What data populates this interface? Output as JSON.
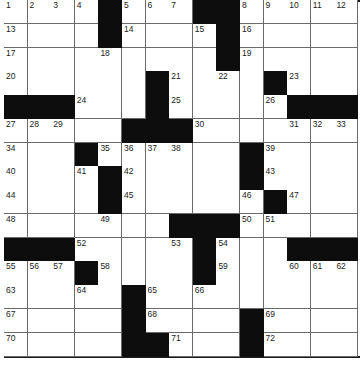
{
  "puzzle": {
    "size": {
      "rows": 15,
      "cols": 15
    },
    "colors": {
      "black": "#0d0d0d",
      "white": "#ffffff",
      "line": "#6a6a6a"
    },
    "grid": [
      "....#...##.....",
      "....#....#.....",
      ".........#.....",
      "......#....#...",
      "###...#.....###",
      ".....###.......",
      "...#......#....",
      "....#.....#....",
      "....#......#...",
      ".......###.....",
      "###.....#...###",
      "...#....#......",
      ".....#.........",
      ".....#....#....",
      ".....##...#...."
    ],
    "numbers": [
      {
        "r": 0,
        "c": 0,
        "n": "1"
      },
      {
        "r": 0,
        "c": 1,
        "n": "2"
      },
      {
        "r": 0,
        "c": 2,
        "n": "3"
      },
      {
        "r": 0,
        "c": 3,
        "n": "4"
      },
      {
        "r": 0,
        "c": 5,
        "n": "5"
      },
      {
        "r": 0,
        "c": 6,
        "n": "6"
      },
      {
        "r": 0,
        "c": 7,
        "n": "7"
      },
      {
        "r": 0,
        "c": 10,
        "n": "8"
      },
      {
        "r": 0,
        "c": 11,
        "n": "9"
      },
      {
        "r": 0,
        "c": 12,
        "n": "10"
      },
      {
        "r": 0,
        "c": 13,
        "n": "11"
      },
      {
        "r": 0,
        "c": 14,
        "n": "12"
      },
      {
        "r": 1,
        "c": 0,
        "n": "13"
      },
      {
        "r": 1,
        "c": 5,
        "n": "14"
      },
      {
        "r": 1,
        "c": 8,
        "n": "15"
      },
      {
        "r": 1,
        "c": 10,
        "n": "16"
      },
      {
        "r": 2,
        "c": 0,
        "n": "17"
      },
      {
        "r": 2,
        "c": 4,
        "n": "18"
      },
      {
        "r": 2,
        "c": 10,
        "n": "19"
      },
      {
        "r": 3,
        "c": 0,
        "n": "20"
      },
      {
        "r": 3,
        "c": 7,
        "n": "21"
      },
      {
        "r": 3,
        "c": 9,
        "n": "22"
      },
      {
        "r": 3,
        "c": 12,
        "n": "23"
      },
      {
        "r": 4,
        "c": 3,
        "n": "24"
      },
      {
        "r": 4,
        "c": 7,
        "n": "25"
      },
      {
        "r": 4,
        "c": 11,
        "n": "26"
      },
      {
        "r": 5,
        "c": 0,
        "n": "27"
      },
      {
        "r": 5,
        "c": 1,
        "n": "28"
      },
      {
        "r": 5,
        "c": 2,
        "n": "29"
      },
      {
        "r": 5,
        "c": 8,
        "n": "30"
      },
      {
        "r": 5,
        "c": 12,
        "n": "31"
      },
      {
        "r": 5,
        "c": 13,
        "n": "32"
      },
      {
        "r": 5,
        "c": 14,
        "n": "33"
      },
      {
        "r": 6,
        "c": 0,
        "n": "34"
      },
      {
        "r": 6,
        "c": 4,
        "n": "35"
      },
      {
        "r": 6,
        "c": 5,
        "n": "36"
      },
      {
        "r": 6,
        "c": 6,
        "n": "37"
      },
      {
        "r": 6,
        "c": 7,
        "n": "38"
      },
      {
        "r": 6,
        "c": 11,
        "n": "39"
      },
      {
        "r": 7,
        "c": 0,
        "n": "40"
      },
      {
        "r": 7,
        "c": 3,
        "n": "41"
      },
      {
        "r": 7,
        "c": 5,
        "n": "42"
      },
      {
        "r": 7,
        "c": 11,
        "n": "43"
      },
      {
        "r": 8,
        "c": 0,
        "n": "44"
      },
      {
        "r": 8,
        "c": 5,
        "n": "45"
      },
      {
        "r": 8,
        "c": 10,
        "n": "46"
      },
      {
        "r": 8,
        "c": 12,
        "n": "47"
      },
      {
        "r": 9,
        "c": 0,
        "n": "48"
      },
      {
        "r": 9,
        "c": 4,
        "n": "49"
      },
      {
        "r": 9,
        "c": 10,
        "n": "50"
      },
      {
        "r": 9,
        "c": 11,
        "n": "51"
      },
      {
        "r": 10,
        "c": 3,
        "n": "52"
      },
      {
        "r": 10,
        "c": 7,
        "n": "53"
      },
      {
        "r": 10,
        "c": 9,
        "n": "54"
      },
      {
        "r": 11,
        "c": 0,
        "n": "55"
      },
      {
        "r": 11,
        "c": 1,
        "n": "56"
      },
      {
        "r": 11,
        "c": 2,
        "n": "57"
      },
      {
        "r": 11,
        "c": 4,
        "n": "58"
      },
      {
        "r": 11,
        "c": 9,
        "n": "59"
      },
      {
        "r": 11,
        "c": 12,
        "n": "60"
      },
      {
        "r": 11,
        "c": 13,
        "n": "61"
      },
      {
        "r": 11,
        "c": 14,
        "n": "62"
      },
      {
        "r": 12,
        "c": 0,
        "n": "63"
      },
      {
        "r": 12,
        "c": 3,
        "n": "64"
      },
      {
        "r": 12,
        "c": 6,
        "n": "65"
      },
      {
        "r": 12,
        "c": 8,
        "n": "66"
      },
      {
        "r": 13,
        "c": 0,
        "n": "67"
      },
      {
        "r": 13,
        "c": 6,
        "n": "68"
      },
      {
        "r": 13,
        "c": 11,
        "n": "69"
      },
      {
        "r": 14,
        "c": 0,
        "n": "70"
      },
      {
        "r": 14,
        "c": 7,
        "n": "71"
      },
      {
        "r": 14,
        "c": 11,
        "n": "72"
      }
    ]
  }
}
